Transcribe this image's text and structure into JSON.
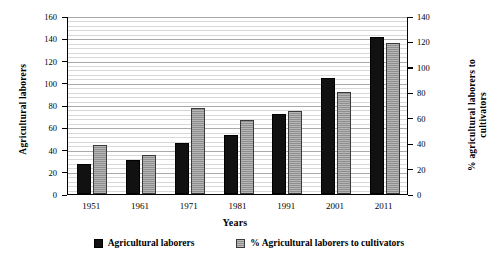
{
  "chart_data": {
    "type": "bar",
    "title": "",
    "categories": [
      "1951",
      "1961",
      "1971",
      "1981",
      "1991",
      "2001",
      "2011"
    ],
    "series": [
      {
        "name": "Agricultural laborers",
        "axis": "left",
        "color": "#111111",
        "values": [
          27,
          31,
          46,
          53,
          72,
          104,
          141
        ]
      },
      {
        "name": "% Agricultural laborers to cultivators",
        "axis": "right",
        "color": "#8f8f8f",
        "values": [
          38.5,
          31,
          68,
          58,
          65,
          80.5,
          119
        ]
      }
    ],
    "xlabel": "Years",
    "ylabel": "Agricultural laborers",
    "y2label": "% agricultural laborers to cultivators",
    "ylim": [
      0,
      160
    ],
    "y2lim": [
      0,
      140
    ],
    "yticks": [
      0,
      20,
      40,
      60,
      80,
      100,
      120,
      140,
      160
    ],
    "y2ticks": [
      0,
      20,
      40,
      60,
      80,
      100,
      120,
      140
    ],
    "grid": true,
    "legend_position": "bottom"
  },
  "legend": {
    "items": [
      {
        "label": "Agricultural laborers",
        "swatch": "black-square-icon"
      },
      {
        "label": "% Agricultural laborers to cultivators",
        "swatch": "gray-square-icon"
      }
    ]
  },
  "axes": {
    "x_title": "Years",
    "y_left_title": "Agricultural laborers",
    "y_right_title": "% agricultural laborers to cultivators"
  }
}
